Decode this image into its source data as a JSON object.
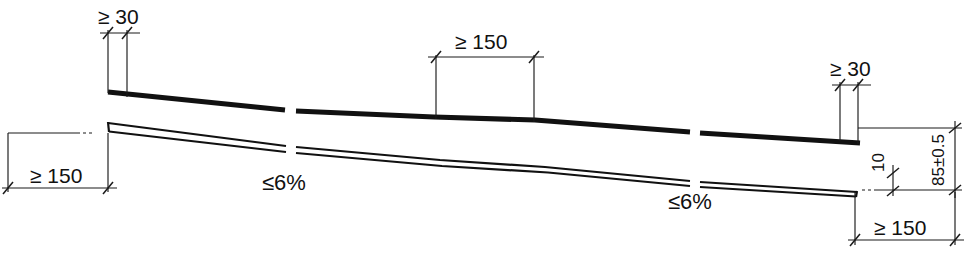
{
  "drawing": {
    "title": "Kerb / slab longitudinal section detail",
    "units_note": "mm",
    "stroke_color": "#111111",
    "dimension_color": "#1a1a1a",
    "background_color": "#ffffff"
  },
  "dimensions": [
    {
      "id": "top-left-min-30",
      "label": "≥ 30",
      "value": 30,
      "qualifier": "minimum",
      "orientation": "horizontal",
      "x1": 108,
      "x2": 127,
      "y": 33,
      "ext_top": 33,
      "ext_bottom": 92,
      "text_x": 98,
      "text_y": 24
    },
    {
      "id": "middle-min-150",
      "label": "≥ 150",
      "value": 150,
      "qualifier": "minimum",
      "orientation": "horizontal",
      "x1": 436,
      "x2": 534,
      "y": 57,
      "ext_top": 57,
      "ext_bottom": 118,
      "text_x": 455,
      "text_y": 49
    },
    {
      "id": "top-right-min-30",
      "label": "≥ 30",
      "value": 30,
      "qualifier": "minimum",
      "orientation": "horizontal",
      "x1": 840,
      "x2": 858,
      "y": 85,
      "ext_top": 85,
      "ext_bottom": 130,
      "text_x": 830,
      "text_y": 76
    },
    {
      "id": "left-min-150",
      "label": "≥ 150",
      "value": 150,
      "qualifier": "minimum",
      "orientation": "horizontal",
      "x1": 8,
      "x2": 108,
      "y": 188,
      "ext_top": 133,
      "ext_bottom": 188,
      "text_x": 30,
      "text_y": 183
    },
    {
      "id": "bottom-right-min-150",
      "label": "≥ 150",
      "value": 150,
      "qualifier": "minimum",
      "orientation": "horizontal",
      "x1": 855,
      "x2": 955,
      "y": 240,
      "ext_top": 190,
      "ext_bottom": 240,
      "text_x": 874,
      "text_y": 235
    },
    {
      "id": "right-height-85",
      "label": "85±0.5",
      "value": 85,
      "tolerance": "±0.5",
      "orientation": "vertical",
      "y1": 128,
      "y2": 190,
      "x": 955,
      "text_x": 944,
      "text_y": 186
    },
    {
      "id": "right-thickness-10",
      "label": "10",
      "value": 10,
      "orientation": "vertical",
      "y1": 172,
      "y2": 190,
      "x": 893,
      "text_x": 885,
      "text_y": 170
    }
  ],
  "annotations": [
    {
      "id": "slope-left",
      "label": "≤6 %",
      "text": "≤6%",
      "value": 6,
      "unit": "%",
      "qualifier": "maximum",
      "x": 262,
      "y": 188
    },
    {
      "id": "slope-right",
      "label": "≤6 %",
      "text": "≤6%",
      "value": 6,
      "unit": "%",
      "qualifier": "maximum",
      "x": 668,
      "y": 207
    }
  ],
  "geometry": {
    "upper_thick_line": {
      "name": "kerb-top-edge",
      "segments": [
        "M108,92 L285,110",
        "M296,111 L434,117 L535,120 L690,132",
        "M700,133 L860,143"
      ]
    },
    "slab_top_line": {
      "name": "slab-top-surface",
      "segments": [
        "M108,123 L286,146",
        "M296,147 L440,160 L545,167 L690,181",
        "M700,182 L857,192"
      ]
    },
    "slab_bottom_line": {
      "name": "slab-bottom-surface",
      "segments": [
        "M109,131 L286,152",
        "M296,153 L442,166 L548,172 L690,186",
        "M700,187 L856,196"
      ]
    },
    "slab_left_edge": {
      "name": "slab-left-end",
      "path": "M108,123 L109,131"
    },
    "slab_right_edge": {
      "name": "slab-right-end",
      "path": "M857,192 L856,196"
    }
  }
}
